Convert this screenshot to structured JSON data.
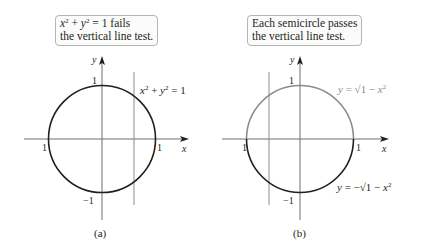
{
  "panel_a": {
    "callout": {
      "line1_var1": "x",
      "line1_plus": " + ",
      "line1_var2": "y",
      "line1_rest": " = 1 fails",
      "line2": "the vertical line test."
    },
    "equation": {
      "var1": "x",
      "plus": " + ",
      "var2": "y",
      "rest": " = 1",
      "exp": "2"
    },
    "axis_x_label": "x",
    "axis_y_label": "y",
    "tick_top": "1",
    "tick_bottom": "−1",
    "tick_left": "1",
    "tick_right": "1",
    "caption": "(a)"
  },
  "panel_b": {
    "callout": {
      "line1": "Each semicircle passes",
      "line2": "the vertical line test."
    },
    "upper_equation": {
      "lhs": "y",
      "mid": " = √1 − ",
      "var": "x",
      "exp": "2"
    },
    "lower_equation": {
      "lhs": "y",
      "mid": " = −√1 − ",
      "var": "x",
      "exp": "2"
    },
    "axis_x_label": "x",
    "axis_y_label": "y",
    "tick_top": "1",
    "tick_bottom": "−1",
    "tick_left": "1",
    "tick_right": "1",
    "caption": "(b)"
  },
  "colors": {
    "axis": "#6d6e71",
    "circle": "#231f20",
    "upper_semicircle": "#8a8a8a",
    "vertical_line": "#8c8c8c",
    "callout_border": "#b5b5b5"
  }
}
